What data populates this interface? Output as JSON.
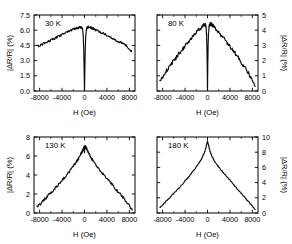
{
  "figure": {
    "background": "#ffffff",
    "trace_color": "#0a0a0a",
    "axis_color": "#000000"
  },
  "chart_data": [
    {
      "type": "line",
      "title": "30 K",
      "panel_position": "top-left",
      "xlabel": "H (Oe)",
      "ylabel": "|ΔR/R| (%)",
      "ylabel_side": "left",
      "xlim": [
        -9000,
        9000
      ],
      "ylim": [
        0.0,
        7.5
      ],
      "xticks": [
        -8000,
        -4000,
        0,
        4000,
        8000
      ],
      "xticklabels": [
        "-8000",
        "-4000",
        "0",
        "4000",
        "8000"
      ],
      "yticks": [
        0.0,
        1.5,
        3.0,
        4.5,
        6.0,
        7.5
      ],
      "yticklabels": [
        "0.0",
        "1.5",
        "3.0",
        "4.5",
        "6.0",
        "7.5"
      ],
      "grid": false,
      "legend": "none",
      "noise_amplitude": 0.11,
      "x": [
        -8400,
        -8000,
        -7500,
        -7000,
        -6500,
        -6000,
        -5500,
        -5000,
        -4500,
        -4000,
        -3500,
        -3000,
        -2500,
        -2000,
        -1600,
        -1300,
        -1000,
        -800,
        -650,
        -520,
        -430,
        -350,
        -280,
        -210,
        -150,
        -100,
        -60,
        -30,
        -10,
        0,
        10,
        30,
        60,
        100,
        150,
        210,
        280,
        350,
        430,
        520,
        650,
        800,
        1000,
        1300,
        1600,
        2000,
        2500,
        3000,
        3500,
        4000,
        4500,
        5000,
        5500,
        6000,
        6500,
        7000,
        7500,
        8000,
        8400
      ],
      "y": [
        4.42,
        4.5,
        4.62,
        4.75,
        4.88,
        5.0,
        5.14,
        5.28,
        5.42,
        5.55,
        5.7,
        5.85,
        5.98,
        6.1,
        6.18,
        6.24,
        6.28,
        6.3,
        6.3,
        6.28,
        6.22,
        6.08,
        5.8,
        5.3,
        4.4,
        3.2,
        1.9,
        0.85,
        0.2,
        0.02,
        0.2,
        0.85,
        1.9,
        3.2,
        4.4,
        5.3,
        5.8,
        6.08,
        6.22,
        6.28,
        6.3,
        6.3,
        6.28,
        6.22,
        6.14,
        6.04,
        5.9,
        5.76,
        5.62,
        5.48,
        5.34,
        5.2,
        5.06,
        4.92,
        4.78,
        4.62,
        4.44,
        4.18,
        3.88
      ]
    },
    {
      "type": "line",
      "title": "80 K",
      "panel_position": "top-right",
      "xlabel": "H (Oe)",
      "ylabel": "|ΔR/R| (%)",
      "ylabel_side": "right",
      "xlim": [
        -9000,
        9000
      ],
      "ylim": [
        0,
        5
      ],
      "xticks": [
        -8000,
        -4000,
        0,
        4000,
        8000
      ],
      "xticklabels": [
        "-8000",
        "-4000",
        "0",
        "4000",
        "8000"
      ],
      "yticks": [
        0,
        1,
        2,
        3,
        4,
        5
      ],
      "yticklabels": [
        "0",
        "1",
        "2",
        "3",
        "4",
        "5"
      ],
      "grid": false,
      "legend": "none",
      "noise_amplitude": 0.12,
      "x": [
        -8500,
        -8000,
        -7500,
        -7000,
        -6500,
        -6000,
        -5500,
        -5000,
        -4500,
        -4000,
        -3500,
        -3000,
        -2500,
        -2000,
        -1600,
        -1300,
        -1000,
        -800,
        -600,
        -450,
        -330,
        -240,
        -170,
        -110,
        -70,
        -35,
        -12,
        0,
        12,
        35,
        70,
        110,
        170,
        240,
        330,
        450,
        600,
        800,
        1000,
        1300,
        1600,
        2000,
        2500,
        3000,
        3500,
        4000,
        4500,
        5000,
        5500,
        6000,
        6500,
        7000,
        7500,
        8000,
        8500
      ],
      "y": [
        0.72,
        0.95,
        1.25,
        1.5,
        1.75,
        2.0,
        2.25,
        2.5,
        2.74,
        2.95,
        3.2,
        3.45,
        3.68,
        3.88,
        4.02,
        4.12,
        4.22,
        4.3,
        4.35,
        4.36,
        4.3,
        4.1,
        3.7,
        3.0,
        2.1,
        1.1,
        0.3,
        0.05,
        0.3,
        1.1,
        2.1,
        3.0,
        3.7,
        4.1,
        4.3,
        4.38,
        4.4,
        4.36,
        4.3,
        4.16,
        4.02,
        3.85,
        3.62,
        3.4,
        3.18,
        2.95,
        2.7,
        2.45,
        2.18,
        1.9,
        1.62,
        1.35,
        1.05,
        0.68,
        0.3
      ]
    },
    {
      "type": "line",
      "title": "130 K",
      "panel_position": "bottom-left",
      "xlabel": "H (Oe)",
      "ylabel": "|ΔR/R| (%)",
      "ylabel_side": "left",
      "xlim": [
        -9000,
        9000
      ],
      "ylim": [
        0,
        8
      ],
      "xticks": [
        -8000,
        -4000,
        0,
        4000,
        8000
      ],
      "xticklabels": [
        "-8000",
        "-4000",
        "0",
        "4000",
        "8000"
      ],
      "yticks": [
        0,
        2,
        4,
        6,
        8
      ],
      "yticklabels": [
        "0",
        "2",
        "4",
        "6",
        "8"
      ],
      "grid": false,
      "legend": "none",
      "noise_amplitude": 0.14,
      "x": [
        -8500,
        -8000,
        -7500,
        -7000,
        -6500,
        -6000,
        -5500,
        -5000,
        -4500,
        -4000,
        -3500,
        -3000,
        -2500,
        -2000,
        -1600,
        -1300,
        -1000,
        -750,
        -550,
        -400,
        -280,
        -190,
        -120,
        -60,
        -25,
        0,
        25,
        60,
        120,
        190,
        280,
        400,
        550,
        750,
        1000,
        1300,
        1600,
        2000,
        2500,
        3000,
        3500,
        4000,
        4500,
        5000,
        5500,
        6000,
        6500,
        7000,
        7500,
        8000,
        8500
      ],
      "y": [
        0.62,
        0.85,
        1.2,
        1.5,
        1.82,
        2.12,
        2.45,
        2.78,
        3.1,
        3.42,
        3.78,
        4.15,
        4.52,
        4.92,
        5.25,
        5.5,
        5.8,
        6.08,
        6.32,
        6.5,
        6.65,
        6.78,
        6.88,
        6.92,
        6.8,
        6.35,
        6.8,
        6.95,
        7.0,
        6.95,
        6.88,
        6.75,
        6.55,
        6.3,
        6.02,
        5.7,
        5.42,
        5.1,
        4.72,
        4.35,
        4.0,
        3.65,
        3.3,
        2.95,
        2.6,
        2.25,
        1.9,
        1.52,
        1.15,
        0.72,
        0.3
      ]
    },
    {
      "type": "line",
      "title": "180 K",
      "panel_position": "bottom-right",
      "xlabel": "H (Oe)",
      "ylabel": "|ΔR/R| (%)",
      "ylabel_side": "right",
      "xlim": [
        -9000,
        9000
      ],
      "ylim": [
        0,
        10
      ],
      "xticks": [
        -8000,
        -4000,
        0,
        4000,
        8000
      ],
      "xticklabels": [
        "-8000",
        "-4000",
        "0",
        "4000",
        "8000"
      ],
      "yticks": [
        0,
        2,
        4,
        6,
        8,
        10
      ],
      "yticklabels": [
        "0",
        "2",
        "4",
        "6",
        "8",
        "10"
      ],
      "grid": false,
      "legend": "none",
      "noise_amplitude": 0.07,
      "x": [
        -8500,
        -8000,
        -7500,
        -7000,
        -6500,
        -6000,
        -5500,
        -5000,
        -4500,
        -4000,
        -3500,
        -3000,
        -2500,
        -2000,
        -1600,
        -1200,
        -900,
        -650,
        -450,
        -280,
        -150,
        -60,
        0,
        60,
        150,
        280,
        450,
        650,
        900,
        1200,
        1600,
        2000,
        2500,
        3000,
        3500,
        4000,
        4500,
        5000,
        5500,
        6000,
        6500,
        7000,
        7500,
        8000,
        8500
      ],
      "y": [
        0.75,
        1.05,
        1.45,
        1.82,
        2.2,
        2.58,
        2.98,
        3.38,
        3.78,
        4.2,
        4.65,
        5.1,
        5.58,
        6.08,
        6.5,
        6.95,
        7.35,
        7.75,
        8.15,
        8.6,
        9.0,
        9.3,
        9.45,
        9.3,
        9.0,
        8.6,
        8.15,
        7.72,
        7.3,
        6.88,
        6.45,
        6.05,
        5.6,
        5.15,
        4.72,
        4.3,
        3.88,
        3.45,
        3.02,
        2.6,
        2.18,
        1.75,
        1.32,
        0.88,
        0.45
      ]
    }
  ]
}
